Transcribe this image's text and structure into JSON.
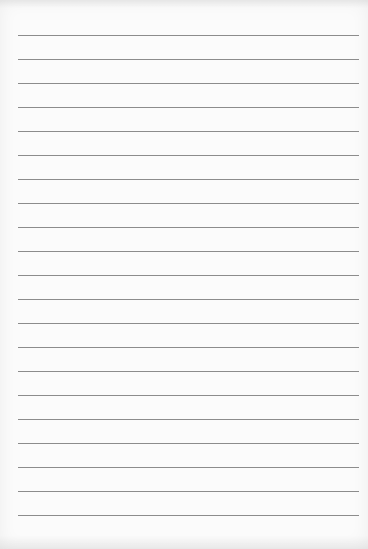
{
  "page": {
    "background_color": "#fbfbfb",
    "line_color": "#8c8c8c",
    "line_left": 18,
    "line_right": 359,
    "first_line_y": 35,
    "line_spacing": 24,
    "line_count": 21,
    "lines": [
      35,
      59,
      83,
      107,
      131,
      155,
      179,
      203,
      227,
      251,
      275,
      299,
      323,
      347,
      371,
      395,
      419,
      443,
      467,
      491,
      515
    ]
  }
}
